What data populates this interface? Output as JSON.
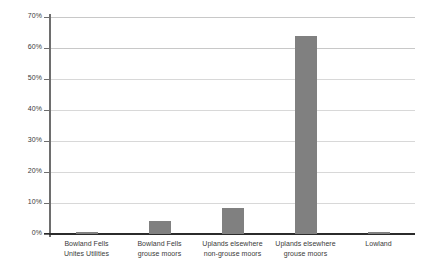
{
  "chart_data": {
    "type": "bar",
    "title": "",
    "subtitle": "",
    "xlabel": "",
    "ylabel": "",
    "categories": [
      "Bowland Fells Unites Utilities",
      "Bowland Fells grouse moors",
      "Uplands elsewhere non-grouse moors",
      "Uplands elsewhere grouse moors",
      "Lowland"
    ],
    "category_lines": [
      [
        "Bowland Fells",
        "Unites Utilities"
      ],
      [
        "Bowland Fells",
        "grouse moors"
      ],
      [
        "Uplands elsewhere",
        "non-grouse moors"
      ],
      [
        "Uplands elsewhere",
        "grouse moors"
      ],
      [
        "Lowland",
        ""
      ]
    ],
    "values": [
      0.5,
      4.3,
      8.5,
      64,
      0.8
    ],
    "value_labels": [
      "0.5%",
      "4.3%",
      "8.5%",
      "64%",
      "0.8%"
    ],
    "ylim": [
      0,
      70
    ],
    "ytick_values": [
      0,
      10,
      20,
      30,
      40,
      50,
      60,
      70
    ],
    "ytick_labels": [
      "0%",
      "10%",
      "20%",
      "30%",
      "40%",
      "50%",
      "60%",
      "70%"
    ],
    "grid": true,
    "grid_axis": "y",
    "legend": false,
    "legend_position": "none",
    "series": [
      {
        "name": "",
        "values": [
          0.5,
          4.3,
          8.5,
          64,
          0.8
        ]
      }
    ]
  },
  "style": {
    "bar_color": "#808080",
    "gridline_color": "#c8c8c8",
    "axis_color": "#6e6e6e",
    "baseline_color": "#2b2b2b",
    "text_color": "#3a3a3a",
    "background": "#ffffff"
  }
}
